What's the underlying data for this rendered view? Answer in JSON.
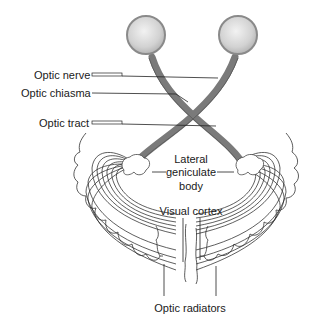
{
  "diagram": {
    "labels": {
      "optic_nerve": "Optic nerve",
      "optic_chiasma": "Optic chiasma",
      "optic_tract": "Optic tract",
      "lgb_line1": "Lateral",
      "lgb_line2": "geniculate",
      "lgb_line3": "body",
      "visual_cortex": "Visual cortex",
      "optic_radiators": "Optic radiators"
    },
    "colors": {
      "eyeball_fill": "#d9d9d9",
      "eyeball_rim": "#8a8a8a",
      "tract": "#7a7a7a",
      "lines": "#2a2a2a",
      "background": "#ffffff"
    }
  }
}
